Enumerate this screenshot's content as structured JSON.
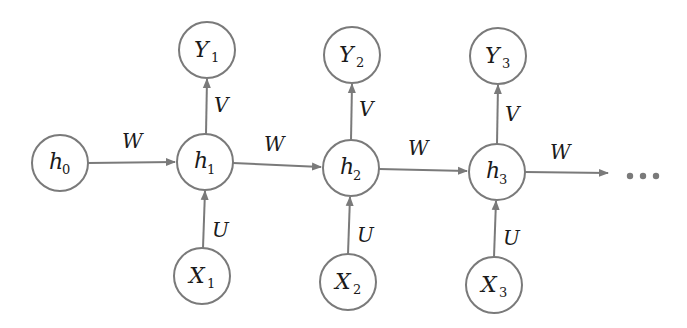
{
  "diagram": {
    "nodes": [
      {
        "id": "h0",
        "base": "h",
        "sub": "0",
        "x": 60,
        "y": 163
      },
      {
        "id": "h1",
        "base": "h",
        "sub": "1",
        "x": 205,
        "y": 162
      },
      {
        "id": "h2",
        "base": "h",
        "sub": "2",
        "x": 351,
        "y": 168
      },
      {
        "id": "h3",
        "base": "h",
        "sub": "3",
        "x": 497,
        "y": 172
      },
      {
        "id": "Y1",
        "base": "Y",
        "sub": "1",
        "x": 207,
        "y": 50
      },
      {
        "id": "Y2",
        "base": "Y",
        "sub": "2",
        "x": 352,
        "y": 55
      },
      {
        "id": "Y3",
        "base": "Y",
        "sub": "3",
        "x": 498,
        "y": 56
      },
      {
        "id": "X1",
        "base": "X",
        "sub": "1",
        "x": 202,
        "y": 276
      },
      {
        "id": "X2",
        "base": "X",
        "sub": "2",
        "x": 348,
        "y": 282
      },
      {
        "id": "X3",
        "base": "X",
        "sub": "3",
        "x": 494,
        "y": 285
      }
    ],
    "edges": [
      {
        "from": "h0",
        "to": "h1",
        "label": "W"
      },
      {
        "from": "h1",
        "to": "h2",
        "label": "W"
      },
      {
        "from": "h2",
        "to": "h3",
        "label": "W"
      },
      {
        "from": "h3",
        "to": "…",
        "label": "W"
      },
      {
        "from": "h1",
        "to": "Y1",
        "label": "V"
      },
      {
        "from": "h2",
        "to": "Y2",
        "label": "V"
      },
      {
        "from": "h3",
        "to": "Y3",
        "label": "V"
      },
      {
        "from": "X1",
        "to": "h1",
        "label": "U"
      },
      {
        "from": "X2",
        "to": "h2",
        "label": "U"
      },
      {
        "from": "X3",
        "to": "h3",
        "label": "U"
      }
    ],
    "labels": {
      "h0": {
        "base": "h",
        "sub": "0"
      },
      "h1": {
        "base": "h",
        "sub": "1"
      },
      "h2": {
        "base": "h",
        "sub": "2"
      },
      "h3": {
        "base": "h",
        "sub": "3"
      },
      "Y1": {
        "base": "Y",
        "sub": "1"
      },
      "Y2": {
        "base": "Y",
        "sub": "2"
      },
      "Y3": {
        "base": "Y",
        "sub": "3"
      },
      "X1": {
        "base": "X",
        "sub": "1"
      },
      "X2": {
        "base": "X",
        "sub": "2"
      },
      "X3": {
        "base": "X",
        "sub": "3"
      },
      "W": "W",
      "V": "V",
      "U": "U"
    },
    "continuation": "…",
    "colors": {
      "stroke": "#7a7a7a",
      "text": "#1a1a1a",
      "background": "#ffffff"
    }
  }
}
